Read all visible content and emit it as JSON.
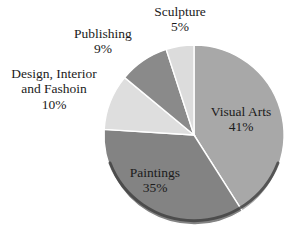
{
  "chart_data": {
    "type": "pie",
    "title": "",
    "categories": [
      "Visual Arts",
      "Paintings",
      "Design, Interior and Fashoin",
      "Publishing",
      "Sculpture"
    ],
    "values": [
      41,
      35,
      10,
      9,
      5
    ],
    "units": "percent",
    "legend": "none",
    "start_angle_deg": 0,
    "direction": "clockwise",
    "slices": [
      {
        "name": "Visual Arts",
        "value": 41,
        "value_text": "41%",
        "color": "#a8a8a8",
        "label_position": "inside"
      },
      {
        "name": "Paintings",
        "value": 35,
        "value_text": "35%",
        "color": "#838383",
        "label_position": "inside"
      },
      {
        "name": "Design, Interior and Fashoin",
        "name_line1": "Design, Interior",
        "name_line2": "and Fashoin",
        "value": 10,
        "value_text": "10%",
        "color": "#dedede",
        "label_position": "outside"
      },
      {
        "name": "Publishing",
        "value": 9,
        "value_text": "9%",
        "color": "#8a8a8a",
        "label_position": "outside"
      },
      {
        "name": "Sculpture",
        "value": 5,
        "value_text": "5%",
        "color": "#dcdcdc",
        "label_position": "outside"
      }
    ]
  },
  "style": {
    "background": "#ffffff",
    "text_color": "#1b1b1b",
    "rim_color": "#3c3c3c",
    "edge_color": "#ffffff"
  }
}
